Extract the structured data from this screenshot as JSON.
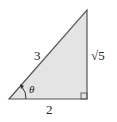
{
  "diagram": {
    "type": "right-triangle",
    "fill_color": "#e4e4e4",
    "stroke_color": "#444444",
    "labels": {
      "hypotenuse": "3",
      "opposite": "√5",
      "adjacent": "2",
      "angle": "θ"
    },
    "right_angle_marker": true
  }
}
